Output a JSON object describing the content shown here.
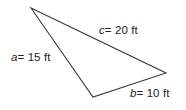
{
  "figure": {
    "type": "triangle-diagram",
    "background_color": "#ffffff",
    "stroke_color": "#3a3a3c",
    "text_color": "#231f20",
    "stroke_width": 1.1,
    "width": 186,
    "height": 110,
    "unit": "ft",
    "vertices": {
      "apex": {
        "name": "A",
        "x": 31,
        "y": 8
      },
      "right": {
        "name": "B",
        "x": 166,
        "y": 73
      },
      "bottom": {
        "name": "C",
        "x": 93,
        "y": 97
      }
    },
    "sides": [
      {
        "id": "a",
        "variable": "a",
        "equals": "=",
        "value": "15",
        "unit": "ft",
        "label": "a = 15 ft",
        "from": "apex",
        "to": "bottom",
        "position": "left"
      },
      {
        "id": "b",
        "variable": "b",
        "equals": "=",
        "value": "10",
        "unit": "ft",
        "label": "b = 10 ft",
        "from": "bottom",
        "to": "right",
        "position": "bottom-right"
      },
      {
        "id": "c",
        "variable": "c",
        "equals": "=",
        "value": "20",
        "unit": "ft",
        "label": "c = 20 ft",
        "from": "apex",
        "to": "right",
        "position": "upper-right"
      }
    ]
  }
}
